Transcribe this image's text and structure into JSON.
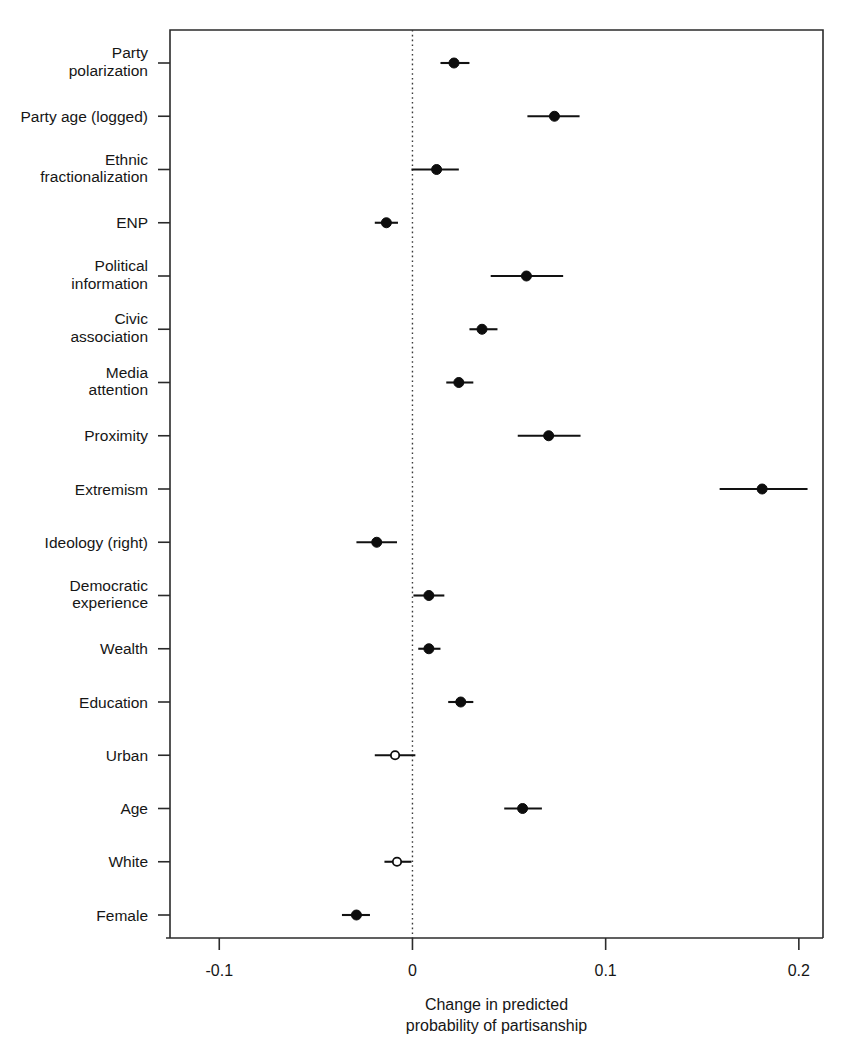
{
  "chart_data": {
    "type": "scatter",
    "title": "",
    "subtitle": "",
    "xlabel_line1": "Change in predicted",
    "xlabel_line2": "probability of partisanship",
    "ylabel": "",
    "xlim": [
      -0.1255,
      0.2125
    ],
    "xticks": [
      -0.1,
      0,
      0.1,
      0.2
    ],
    "xtick_labels": [
      "-0.1",
      "0",
      "0.1",
      "0.2"
    ],
    "grid": false,
    "legend": "none",
    "reference_line": 0,
    "reference_line_style": "dotted",
    "point_styles": {
      "filled": "significant (95% CI excludes 0)",
      "open": "not significant"
    },
    "categories": [
      "Party polarization",
      "Party age (logged)",
      "Ethnic fractionalization",
      "ENP",
      "Political information",
      "Civic association",
      "Media attention",
      "Proximity",
      "Extremism",
      "Ideology (right)",
      "Democratic experience",
      "Wealth",
      "Education",
      "Urban",
      "Age",
      "White",
      "Female"
    ],
    "category_label_lines": [
      [
        "Party",
        "polarization"
      ],
      [
        "Party age (logged)"
      ],
      [
        "Ethnic",
        "fractionalization"
      ],
      [
        "ENP"
      ],
      [
        "Political",
        "information"
      ],
      [
        "Civic",
        "association"
      ],
      [
        "Media",
        "attention"
      ],
      [
        "Proximity"
      ],
      [
        "Extremism"
      ],
      [
        "Ideology (right)"
      ],
      [
        "Democratic",
        "experience"
      ],
      [
        "Wealth"
      ],
      [
        "Education"
      ],
      [
        "Urban"
      ],
      [
        "Age"
      ],
      [
        "White"
      ],
      [
        "Female"
      ]
    ],
    "values": [
      0.0215,
      0.0735,
      0.0125,
      -0.0135,
      0.059,
      0.036,
      0.024,
      0.0705,
      0.181,
      -0.0185,
      0.0085,
      0.0085,
      0.025,
      -0.009,
      0.057,
      -0.008,
      -0.029
    ],
    "ci_low": [
      0.0145,
      0.0595,
      -0.0005,
      -0.0195,
      0.0405,
      0.0295,
      0.0175,
      0.0545,
      0.159,
      -0.029,
      0.0005,
      0.003,
      0.0185,
      -0.0195,
      0.0475,
      -0.0145,
      -0.0365
    ],
    "ci_high": [
      0.0295,
      0.0865,
      0.024,
      -0.0075,
      0.078,
      0.044,
      0.0315,
      0.087,
      0.2045,
      -0.008,
      0.0165,
      0.0145,
      0.0315,
      0.0015,
      0.067,
      -0.0005,
      -0.022
    ],
    "marker": [
      "filled",
      "filled",
      "filled",
      "filled",
      "filled",
      "filled",
      "filled",
      "filled",
      "filled",
      "filled",
      "filled",
      "filled",
      "filled",
      "open",
      "filled",
      "open",
      "filled"
    ]
  },
  "colors": {
    "background": "#ffffff",
    "axis": "#2b2b2b",
    "point": "#0d0d0d",
    "reference": "#3a3a3a"
  }
}
